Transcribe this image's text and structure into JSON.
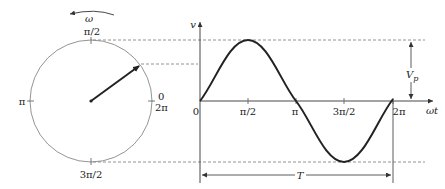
{
  "phasor": {
    "rotation_label": "ω",
    "labels": {
      "top": "π/2",
      "left": "π",
      "right_top": "0",
      "right_bottom": "2π",
      "bottom": "3π/2"
    }
  },
  "waveform": {
    "y_axis_label": "v",
    "x_axis_label": "ωt",
    "x_ticks": [
      "0",
      "π/2",
      "π",
      "3π/2",
      "2π"
    ],
    "amplitude_label": "Vp",
    "amplitude_label_main": "V",
    "amplitude_label_sub": "p",
    "period_label": "T"
  },
  "colors": {
    "stroke": "#222222",
    "circle": "#888888",
    "dashed": "#777777"
  }
}
